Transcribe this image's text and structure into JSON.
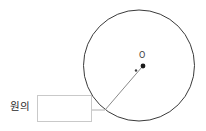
{
  "canvas": {
    "width": 206,
    "height": 131,
    "background_color": "#ffffff"
  },
  "diagram": {
    "stroke_color": "#3a3a3a",
    "leader_color": "#8a8a8a",
    "center_label": "O",
    "center_label_name": "circle-center-letter-o"
  },
  "prompt": {
    "label_text": "원의",
    "answer_value": "",
    "answer_placeholder": ""
  },
  "chart_data": {
    "type": "scatter",
    "title": "원의",
    "xlabel": "",
    "ylabel": "",
    "xlim": [
      0,
      206
    ],
    "ylim": [
      0,
      131
    ],
    "grid": false,
    "legend": "none",
    "shapes": [
      {
        "name": "main-circle",
        "kind": "circle",
        "cx": 139,
        "cy": 65.5,
        "r": 55.5,
        "stroke": "#3a3a3a",
        "stroke_width": 1,
        "fill": "none"
      },
      {
        "name": "center-dot",
        "kind": "point",
        "cx": 143,
        "cy": 66,
        "r": 2.4,
        "fill": "#1a1a1a"
      },
      {
        "name": "leader-dot",
        "kind": "point",
        "cx": 136,
        "cy": 70.5,
        "r": 1.2,
        "fill": "#3d3d3d"
      },
      {
        "name": "leader-diagonal",
        "kind": "line",
        "x1": 105,
        "y1": 110,
        "x2": 142,
        "y2": 67,
        "stroke": "#8a8a8a",
        "stroke_width": 1
      },
      {
        "name": "leader-horizontal",
        "kind": "line",
        "x1": 92,
        "y1": 110,
        "x2": 105,
        "y2": 110,
        "stroke": "#b0b0b0",
        "stroke_width": 1
      }
    ],
    "annotations": [
      {
        "name": "center-label",
        "text": "O",
        "x": 142,
        "y": 56
      },
      {
        "name": "prompt-label",
        "text": "원의",
        "x": 10,
        "y": 110
      }
    ]
  }
}
